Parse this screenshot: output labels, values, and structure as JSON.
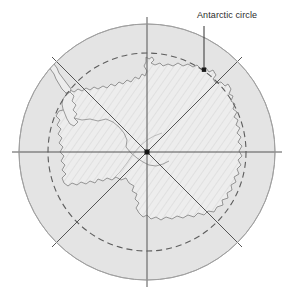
{
  "figure": {
    "type": "map",
    "projection": "polar-stereographic",
    "center_label": "South Pole"
  },
  "annotations": [
    {
      "id": "antarctic-circle",
      "text": "Antarctic circle",
      "label_x": 197,
      "label_y": 10,
      "leader_from_x": 204,
      "leader_from_y": 26,
      "leader_to_x": 204,
      "leader_to_y": 70,
      "marker": "square"
    }
  ],
  "geometry": {
    "center_x": 147,
    "center_y": 152,
    "outer_circle_radius": 128,
    "dashed_circle_radius": 99,
    "radial_line_count": 8,
    "radial_line_overshoot": 12
  },
  "colors": {
    "ocean_fill": "#e4e4e4",
    "land_fill": "#ededed",
    "outline": "#9a9a9a",
    "coastline": "#8c8c8c",
    "graticule": "#555555",
    "dashed_circle": "#5d5d5d",
    "label_text": "#2b2b2b",
    "background": "#ffffff",
    "hatch": "#d2d2d2",
    "pole_marker": "#111111"
  }
}
